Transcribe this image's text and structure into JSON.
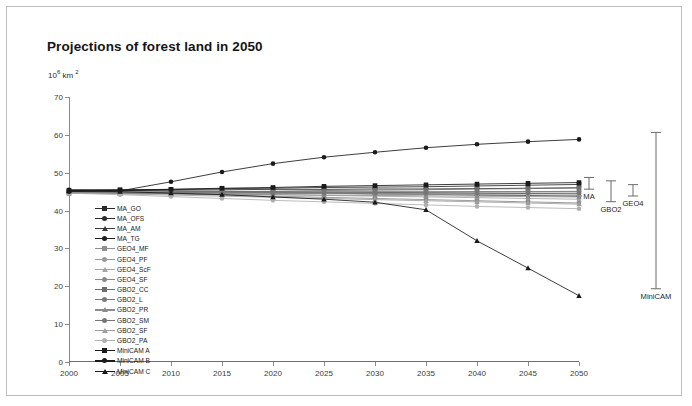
{
  "chart_data": {
    "type": "line",
    "title": "Projections of forest land in 2050",
    "ylabel": "10⁶ km ²",
    "xlabel": "",
    "xlim": [
      2000,
      2050
    ],
    "ylim": [
      0,
      70
    ],
    "yticks": [
      0,
      10,
      20,
      30,
      40,
      50,
      60,
      70
    ],
    "x": [
      2000,
      2005,
      2010,
      2015,
      2020,
      2025,
      2030,
      2035,
      2040,
      2045,
      2050
    ],
    "grid": false,
    "legend_position": "inside-left",
    "series": [
      {
        "name": "MA_GO",
        "marker": "square",
        "color": "#2b2b2b",
        "values": [
          45.4,
          45.5,
          45.6,
          45.8,
          45.9,
          46.1,
          46.2,
          46.3,
          46.5,
          46.7,
          46.9
        ]
      },
      {
        "name": "MA_OFS",
        "marker": "circle",
        "color": "#2b2b2b",
        "values": [
          45.4,
          45.4,
          45.5,
          45.5,
          45.6,
          45.6,
          45.7,
          45.7,
          45.8,
          45.9,
          46.0
        ]
      },
      {
        "name": "MA_AM",
        "marker": "triangle",
        "color": "#3a3a3a",
        "values": [
          45.4,
          45.3,
          45.2,
          45.1,
          45.0,
          44.9,
          44.8,
          44.7,
          44.6,
          44.5,
          44.4
        ]
      },
      {
        "name": "MA_TG",
        "marker": "circle",
        "color": "#1e1e1e",
        "values": [
          45.4,
          45.3,
          45.1,
          44.9,
          44.7,
          44.6,
          44.4,
          44.3,
          44.1,
          44.0,
          43.8
        ]
      },
      {
        "name": "GEO4_MF",
        "marker": "square",
        "color": "#8f8f8f",
        "values": [
          45.0,
          45.0,
          45.0,
          45.0,
          45.0,
          45.0,
          45.0,
          45.0,
          45.0,
          45.0,
          45.0
        ]
      },
      {
        "name": "GEO4_PF",
        "marker": "circle",
        "color": "#9a9a9a",
        "values": [
          45.0,
          44.9,
          44.8,
          44.7,
          44.6,
          44.5,
          44.4,
          44.3,
          44.2,
          44.1,
          44.0
        ]
      },
      {
        "name": "GEO4_ScF",
        "marker": "triangle",
        "color": "#a5a5a5",
        "values": [
          45.0,
          44.8,
          44.6,
          44.4,
          44.2,
          44.0,
          43.8,
          43.6,
          43.4,
          43.2,
          43.0
        ]
      },
      {
        "name": "GEO4_SF",
        "marker": "circle",
        "color": "#8a8a8a",
        "values": [
          45.0,
          44.7,
          44.4,
          44.1,
          43.8,
          43.5,
          43.2,
          42.9,
          42.6,
          42.3,
          42.0
        ]
      },
      {
        "name": "GBO2_CC",
        "marker": "square",
        "color": "#6e6e6e",
        "values": [
          44.6,
          44.7,
          44.8,
          45.0,
          45.1,
          45.3,
          45.4,
          45.5,
          45.7,
          45.8,
          46.0
        ]
      },
      {
        "name": "GBO2_L",
        "marker": "circle",
        "color": "#7a7a7a",
        "values": [
          44.6,
          44.6,
          44.7,
          44.7,
          44.8,
          44.8,
          44.9,
          44.9,
          45.0,
          45.0,
          45.1
        ]
      },
      {
        "name": "GBO2_PR",
        "marker": "triangle",
        "color": "#8c8c8c",
        "values": [
          44.6,
          44.5,
          44.4,
          44.3,
          44.2,
          44.1,
          44.0,
          43.9,
          43.8,
          43.7,
          43.6
        ]
      },
      {
        "name": "GBO2_SM",
        "marker": "circle",
        "color": "#767676",
        "values": [
          44.6,
          44.6,
          44.6,
          44.6,
          44.6,
          44.6,
          44.6,
          44.6,
          44.6,
          44.6,
          44.6
        ]
      },
      {
        "name": "GBO2_SF",
        "marker": "triangle",
        "color": "#9e9e9e",
        "values": [
          44.6,
          44.4,
          44.1,
          43.8,
          43.5,
          43.2,
          42.9,
          42.6,
          42.3,
          42.0,
          41.7
        ]
      },
      {
        "name": "GBO2_PA",
        "marker": "circle",
        "color": "#b0b0b0",
        "values": [
          44.6,
          44.2,
          43.7,
          43.2,
          42.7,
          42.3,
          41.9,
          41.5,
          41.1,
          40.8,
          40.5
        ]
      },
      {
        "name": "MiniCAM A",
        "marker": "square",
        "color": "#1a1a1a",
        "values": [
          45.2,
          45.4,
          45.6,
          45.9,
          46.1,
          46.4,
          46.6,
          46.8,
          47.0,
          47.2,
          47.4
        ]
      },
      {
        "name": "MiniCAM B",
        "marker": "circle",
        "color": "#1a1a1a",
        "values": [
          45.0,
          45.2,
          47.6,
          50.2,
          52.4,
          54.1,
          55.4,
          56.6,
          57.5,
          58.2,
          58.8
        ]
      },
      {
        "name": "MiniCAM C",
        "marker": "triangle",
        "color": "#1a1a1a",
        "values": [
          45.2,
          45.0,
          44.6,
          44.2,
          43.6,
          43.0,
          42.2,
          40.2,
          32.0,
          24.8,
          17.5
        ]
      }
    ],
    "annotations": [
      {
        "label": "MA",
        "low": 43.8,
        "high": 46.9
      },
      {
        "label": "GBO2",
        "low": 40.5,
        "high": 46.0
      },
      {
        "label": "GEO4",
        "low": 42.0,
        "high": 45.0
      },
      {
        "label": "MiniCAM",
        "low": 17.5,
        "high": 58.8
      }
    ]
  }
}
